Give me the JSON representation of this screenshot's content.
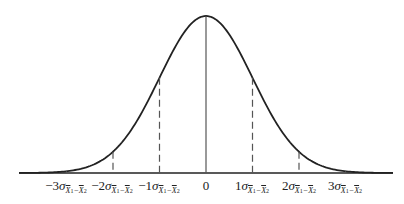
{
  "diagram": {
    "type": "normal-distribution-curve",
    "colors": {
      "curve": "#222222",
      "axis": "#222222",
      "mean_line": "#555555",
      "dashed_lines": "#555555",
      "background": "#ffffff"
    },
    "center_label": "0",
    "subscript_text": "x̄1−x̄2",
    "ticks": [
      {
        "k": -3,
        "coef": "−3",
        "sigma": "σ",
        "sub_a": "X",
        "sub_a_idx": "1",
        "sub_op": "−",
        "sub_b": "X",
        "sub_b_idx": "2",
        "line": "dashed"
      },
      {
        "k": -2,
        "coef": "−2",
        "sigma": "σ",
        "sub_a": "X",
        "sub_a_idx": "1",
        "sub_op": "−",
        "sub_b": "X",
        "sub_b_idx": "2",
        "line": "dashed"
      },
      {
        "k": -1,
        "coef": "−1",
        "sigma": "σ",
        "sub_a": "X",
        "sub_a_idx": "1",
        "sub_op": "−",
        "sub_b": "X",
        "sub_b_idx": "2",
        "line": "dashed"
      },
      {
        "k": 0,
        "coef": "0",
        "sigma": "",
        "line": "solid"
      },
      {
        "k": 1,
        "coef": "1",
        "sigma": "σ",
        "sub_a": "X",
        "sub_a_idx": "1",
        "sub_op": "−",
        "sub_b": "X",
        "sub_b_idx": "2",
        "line": "dashed"
      },
      {
        "k": 2,
        "coef": "2",
        "sigma": "σ",
        "sub_a": "X",
        "sub_a_idx": "1",
        "sub_op": "−",
        "sub_b": "X",
        "sub_b_idx": "2",
        "line": "dashed"
      },
      {
        "k": 3,
        "coef": "3",
        "sigma": "σ",
        "sub_a": "X",
        "sub_a_idx": "1",
        "sub_op": "−",
        "sub_b": "X",
        "sub_b_idx": "2",
        "line": "dashed"
      }
    ]
  },
  "labels": {
    "m3": {
      "coef": "−3",
      "sigma": "σ",
      "a": "X",
      "ai": "1",
      "op": "−",
      "b": "X",
      "bi": "2"
    },
    "m2": {
      "coef": "−2",
      "sigma": "σ",
      "a": "X",
      "ai": "1",
      "op": "−",
      "b": "X",
      "bi": "2"
    },
    "m1": {
      "coef": "−1",
      "sigma": "σ",
      "a": "X",
      "ai": "1",
      "op": "−",
      "b": "X",
      "bi": "2"
    },
    "zero": {
      "coef": "0"
    },
    "p1": {
      "coef": "1",
      "sigma": "σ",
      "a": "X",
      "ai": "1",
      "op": "−",
      "b": "X",
      "bi": "2"
    },
    "p2": {
      "coef": "2",
      "sigma": "σ",
      "a": "X",
      "ai": "1",
      "op": "−",
      "b": "X",
      "bi": "2"
    },
    "p3": {
      "coef": "3",
      "sigma": "σ",
      "a": "X",
      "ai": "1",
      "op": "−",
      "b": "X",
      "bi": "2"
    }
  }
}
